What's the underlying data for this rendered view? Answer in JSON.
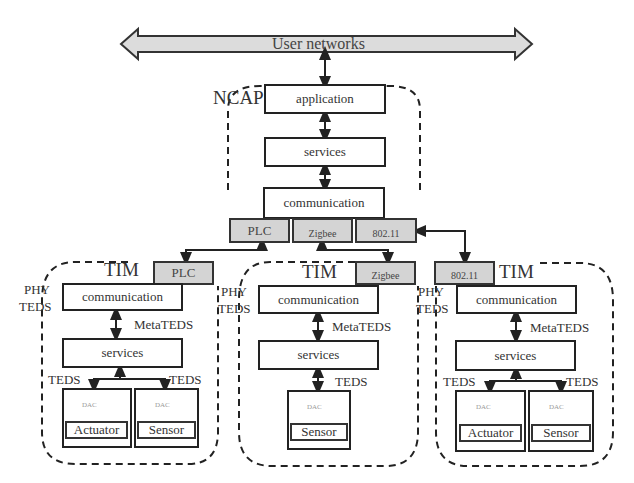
{
  "diagram": {
    "bus": {
      "label": "User networks"
    },
    "ncap": {
      "title": "NCAP",
      "layers": [
        "application",
        "services",
        "communication"
      ],
      "ports": [
        "PLC",
        "Zigbee",
        "802.11"
      ]
    },
    "tims": [
      {
        "title": "TIM",
        "port": "PLC",
        "phy_teds": [
          "PHY",
          "TEDS"
        ],
        "communication": "communication",
        "meta_teds": "MetaTEDS",
        "services": "services",
        "devices": [
          {
            "teds": "TEDS",
            "dac": "DAC",
            "name": "Actuator"
          },
          {
            "teds": "TEDS",
            "dac": "DAC",
            "name": "Sensor"
          }
        ]
      },
      {
        "title": "TIM",
        "port": "Zigbee",
        "phy_teds": [
          "PHY",
          "TEDS"
        ],
        "communication": "communication",
        "meta_teds": "MetaTEDS",
        "services": "services",
        "devices": [
          {
            "teds": "TEDS",
            "dac": "DAC",
            "name": "Sensor"
          }
        ]
      },
      {
        "title": "TIM",
        "port": "802.11",
        "phy_teds": [
          "PHY",
          "TEDS"
        ],
        "communication": "communication",
        "meta_teds": "MetaTEDS",
        "services": "services",
        "devices": [
          {
            "teds": "TEDS",
            "dac": "DAC",
            "name": "Actuator"
          },
          {
            "teds": "TEDS",
            "dac": "DAC",
            "name": "Sensor"
          }
        ]
      }
    ],
    "colors": {
      "line": "#222222",
      "port_fill": "#d4d4d4",
      "bus_fill": "#dcdcdc"
    }
  }
}
